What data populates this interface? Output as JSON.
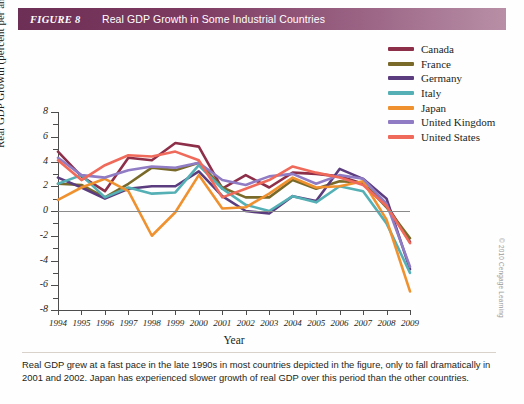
{
  "header": {
    "tag": "FIGURE 8",
    "title": "Real GDP Growth in Some Industrial Countries"
  },
  "caption": "Real GDP grew at a fast pace in the late 1990s in most countries depicted in the figure, only to fall dramatically in 2001 and 2002. Japan has experienced slower growth of real GDP over this period than the other countries.",
  "credit": "© 2010 Cengage Learning",
  "legend": {
    "position": "top-right",
    "items": [
      {
        "label": "Canada",
        "color": "#8e2f4a"
      },
      {
        "label": "France",
        "color": "#7a6a2a"
      },
      {
        "label": "Germany",
        "color": "#5b3c7e"
      },
      {
        "label": "Italy",
        "color": "#54b0b5"
      },
      {
        "label": "Japan",
        "color": "#f0912f"
      },
      {
        "label": "United Kingdom",
        "color": "#8f7cc4"
      },
      {
        "label": "United States",
        "color": "#ef6a5a"
      }
    ]
  },
  "chart_data": {
    "type": "line",
    "title": "Real GDP Growth in Some Industrial Countries",
    "xlabel": "Year",
    "ylabel": "Real GDP Growth (percent per annum)",
    "x": [
      1994,
      1995,
      1996,
      1997,
      1998,
      1999,
      2000,
      2001,
      2002,
      2003,
      2004,
      2005,
      2006,
      2007,
      2008,
      2009
    ],
    "xlim": [
      1994,
      2009
    ],
    "ylim": [
      -8,
      8
    ],
    "yticks": [
      -8,
      -6,
      -4,
      -2,
      0,
      2,
      4,
      6,
      8
    ],
    "ytick_labels": [
      "-8",
      "-6",
      "-4",
      "-2",
      "0",
      "2",
      "4",
      "6",
      "8"
    ],
    "xtick_labels": [
      "1994",
      "1995",
      "1996",
      "1997",
      "1998",
      "1999",
      "2000",
      "2001",
      "2002",
      "2003",
      "2004",
      "2005",
      "2006",
      "2007",
      "2008",
      "2009"
    ],
    "grid": false,
    "zero_line": true,
    "series": [
      {
        "name": "Canada",
        "color": "#8e2f4a",
        "values": [
          4.8,
          2.8,
          1.6,
          4.3,
          4.1,
          5.5,
          5.2,
          1.8,
          2.9,
          1.9,
          3.1,
          3.0,
          2.8,
          2.2,
          0.5,
          -2.5
        ]
      },
      {
        "name": "France",
        "color": "#7a6a2a",
        "values": [
          2.2,
          2.1,
          1.1,
          2.2,
          3.5,
          3.3,
          3.9,
          1.9,
          1.1,
          1.1,
          2.5,
          1.8,
          2.4,
          2.3,
          0.3,
          -2.2
        ]
      },
      {
        "name": "Germany",
        "color": "#5b3c7e",
        "values": [
          2.7,
          1.9,
          1.0,
          1.8,
          2.0,
          2.0,
          3.2,
          1.2,
          0.0,
          -0.2,
          1.2,
          0.8,
          3.4,
          2.6,
          1.0,
          -4.7
        ]
      },
      {
        "name": "Italy",
        "color": "#54b0b5",
        "values": [
          2.2,
          2.9,
          1.1,
          1.9,
          1.4,
          1.5,
          3.7,
          1.8,
          0.5,
          0.0,
          1.2,
          0.7,
          2.0,
          1.6,
          -1.0,
          -5.0
        ]
      },
      {
        "name": "Japan",
        "color": "#f0912f",
        "values": [
          0.9,
          1.9,
          2.6,
          1.6,
          -2.0,
          -0.1,
          2.9,
          0.2,
          0.3,
          1.4,
          2.7,
          1.9,
          2.0,
          2.4,
          -0.7,
          -6.5
        ]
      },
      {
        "name": "United Kingdom",
        "color": "#8f7cc4",
        "values": [
          4.3,
          2.9,
          2.7,
          3.3,
          3.6,
          3.5,
          3.9,
          2.5,
          2.1,
          2.8,
          3.0,
          2.2,
          2.9,
          2.6,
          0.6,
          -4.5
        ]
      },
      {
        "name": "United States",
        "color": "#ef6a5a",
        "values": [
          4.1,
          2.5,
          3.7,
          4.5,
          4.4,
          4.8,
          4.1,
          1.1,
          1.8,
          2.5,
          3.6,
          3.1,
          2.7,
          2.1,
          0.4,
          -2.6
        ]
      }
    ]
  }
}
